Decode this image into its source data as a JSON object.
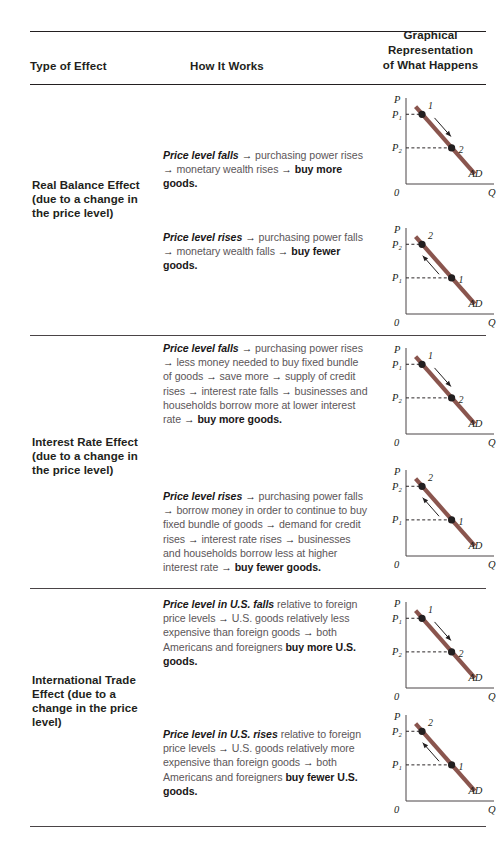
{
  "table": {
    "headers": {
      "type_of_effect": "Type of Effect",
      "how_it_works": "How It Works",
      "graphical_line1": "Graphical",
      "graphical_line2": "Representation",
      "graphical_line3": "of What Happens"
    },
    "rows": [
      {
        "effect_label": "Real Balance Effect (due to a change in the price level)",
        "cases": [
          {
            "text_html": "<i>Price level falls</i> <span class=\"arw\">→</span> purchasing power rises <span class=\"arw\">→</span> monetary wealth rises <span class=\"arw\">→</span> <b>buy more goods.</b>",
            "graph": {
              "y_axis_label": "P",
              "x_axis_label": "Q",
              "origin_label": "0",
              "curve_label": "AD",
              "upper_tick_label": "P₁",
              "lower_tick_label": "P₂",
              "point_upper_label": "1",
              "point_lower_label": "2",
              "arrow_direction": "down-right"
            }
          },
          {
            "text_html": "<i>Price level rises</i> <span class=\"arw\">→</span> purchasing power falls <span class=\"arw\">→</span> monetary wealth falls <span class=\"arw\">→</span> <b>buy fewer goods.</b>",
            "graph": {
              "y_axis_label": "P",
              "x_axis_label": "Q",
              "origin_label": "0",
              "curve_label": "AD",
              "upper_tick_label": "P₂",
              "lower_tick_label": "P₁",
              "point_upper_label": "2",
              "point_lower_label": "1",
              "arrow_direction": "up-left"
            }
          }
        ]
      },
      {
        "effect_label": "Interest Rate Effect (due to a change in the price level)",
        "cases": [
          {
            "text_html": "<i>Price level falls</i> <span class=\"arw\">→</span> purchasing power rises <span class=\"arw\">→</span> less money needed to buy fixed bundle of goods <span class=\"arw\">→</span> save more <span class=\"arw\">→</span> supply of credit rises <span class=\"arw\">→</span> interest rate falls <span class=\"arw\">→</span> businesses and households borrow more at lower interest rate <span class=\"arw\">→</span> <b>buy more goods.</b>",
            "graph": {
              "y_axis_label": "P",
              "x_axis_label": "Q",
              "origin_label": "0",
              "curve_label": "AD",
              "upper_tick_label": "P₁",
              "lower_tick_label": "P₂",
              "point_upper_label": "1",
              "point_lower_label": "2",
              "arrow_direction": "down-right"
            }
          },
          {
            "text_html": "<i>Price level rises</i> <span class=\"arw\">→</span> purchasing power falls <span class=\"arw\">→</span> borrow money in order to continue to buy fixed bundle of goods <span class=\"arw\">→</span> demand for credit rises <span class=\"arw\">→</span> interest rate rises <span class=\"arw\">→</span> businesses and households borrow less at higher interest rate <span class=\"arw\">→</span> <b>buy fewer goods.</b>",
            "graph": {
              "y_axis_label": "P",
              "x_axis_label": "Q",
              "origin_label": "0",
              "curve_label": "AD",
              "upper_tick_label": "P₂",
              "lower_tick_label": "P₁",
              "point_upper_label": "2",
              "point_lower_label": "1",
              "arrow_direction": "up-left"
            }
          }
        ]
      },
      {
        "effect_label": "International Trade Effect (due to a change in the price level)",
        "cases": [
          {
            "text_html": "<i>Price level in U.S. falls</i> relative to foreign price levels <span class=\"arw\">→</span> U.S. goods relatively less expensive than foreign goods <span class=\"arw\">→</span> both Americans and foreigners <b>buy more U.S. goods.</b>",
            "graph": {
              "y_axis_label": "P",
              "x_axis_label": "Q",
              "origin_label": "0",
              "curve_label": "AD",
              "upper_tick_label": "P₁",
              "lower_tick_label": "P₂",
              "point_upper_label": "1",
              "point_lower_label": "2",
              "arrow_direction": "down-right"
            }
          },
          {
            "text_html": "<i>Price level in U.S. rises</i> relative to foreign price levels <span class=\"arw\">→</span> U.S. goods relatively more expensive than foreign goods <span class=\"arw\">→</span> both Americans and foreigners <b>buy fewer U.S. goods.</b>",
            "graph": {
              "y_axis_label": "P",
              "x_axis_label": "Q",
              "origin_label": "0",
              "curve_label": "AD",
              "upper_tick_label": "P₂",
              "lower_tick_label": "P₁",
              "point_upper_label": "2",
              "point_lower_label": "1",
              "arrow_direction": "up-left"
            }
          }
        ]
      }
    ]
  },
  "colors": {
    "ad_curve": "#8a554e",
    "text": "#231f20",
    "body_text": "#5c5659",
    "axis": "#4a4446"
  },
  "chart_data": {
    "type": "line",
    "xlabel": "Q",
    "ylabel": "P",
    "charts": [
      {
        "name": "real-balance-price-falls",
        "series": [
          {
            "name": "AD",
            "x": [
              0.12,
              0.86
            ],
            "y": [
              0.92,
              0.12
            ]
          }
        ],
        "points": [
          {
            "label": "1",
            "x": 0.2,
            "y": 0.83,
            "tick": "P₁"
          },
          {
            "label": "2",
            "x": 0.57,
            "y": 0.43,
            "tick": "P₂"
          }
        ],
        "annotation": {
          "arrow_from": "1",
          "arrow_to": "2"
        }
      },
      {
        "name": "real-balance-price-rises",
        "series": [
          {
            "name": "AD",
            "x": [
              0.12,
              0.86
            ],
            "y": [
              0.92,
              0.12
            ]
          }
        ],
        "points": [
          {
            "label": "2",
            "x": 0.2,
            "y": 0.83,
            "tick": "P₂"
          },
          {
            "label": "1",
            "x": 0.57,
            "y": 0.43,
            "tick": "P₁"
          }
        ],
        "annotation": {
          "arrow_from": "1",
          "arrow_to": "2"
        }
      },
      {
        "name": "interest-rate-price-falls",
        "series": [
          {
            "name": "AD",
            "x": [
              0.12,
              0.86
            ],
            "y": [
              0.92,
              0.12
            ]
          }
        ],
        "points": [
          {
            "label": "1",
            "x": 0.2,
            "y": 0.83,
            "tick": "P₁"
          },
          {
            "label": "2",
            "x": 0.57,
            "y": 0.43,
            "tick": "P₂"
          }
        ],
        "annotation": {
          "arrow_from": "1",
          "arrow_to": "2"
        }
      },
      {
        "name": "interest-rate-price-rises",
        "series": [
          {
            "name": "AD",
            "x": [
              0.12,
              0.86
            ],
            "y": [
              0.92,
              0.12
            ]
          }
        ],
        "points": [
          {
            "label": "2",
            "x": 0.2,
            "y": 0.83,
            "tick": "P₂"
          },
          {
            "label": "1",
            "x": 0.57,
            "y": 0.43,
            "tick": "P₁"
          }
        ],
        "annotation": {
          "arrow_from": "1",
          "arrow_to": "2"
        }
      },
      {
        "name": "international-trade-price-falls",
        "series": [
          {
            "name": "AD",
            "x": [
              0.12,
              0.86
            ],
            "y": [
              0.92,
              0.12
            ]
          }
        ],
        "points": [
          {
            "label": "1",
            "x": 0.2,
            "y": 0.83,
            "tick": "P₁"
          },
          {
            "label": "2",
            "x": 0.57,
            "y": 0.43,
            "tick": "P₂"
          }
        ],
        "annotation": {
          "arrow_from": "1",
          "arrow_to": "2"
        }
      },
      {
        "name": "international-trade-price-rises",
        "series": [
          {
            "name": "AD",
            "x": [
              0.12,
              0.86
            ],
            "y": [
              0.92,
              0.12
            ]
          }
        ],
        "points": [
          {
            "label": "2",
            "x": 0.2,
            "y": 0.83,
            "tick": "P₂"
          },
          {
            "label": "1",
            "x": 0.57,
            "y": 0.43,
            "tick": "P₁"
          }
        ],
        "annotation": {
          "arrow_from": "1",
          "arrow_to": "2"
        }
      }
    ],
    "grid": false,
    "legend": "none"
  }
}
